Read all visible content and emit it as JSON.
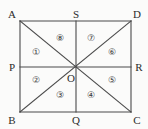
{
  "figure": {
    "type": "geometry-diagram",
    "shape": "rectangle-with-diagonals-and-midlines",
    "canvas": {
      "width": 148,
      "height": 129
    },
    "background_color": "#fbfbfa",
    "line_color": "#4a4a4a",
    "label_color": "#2b2b2b",
    "rectangle": {
      "corners": [
        {
          "name": "A",
          "x": 20,
          "y": 21
        },
        {
          "name": "D",
          "x": 131,
          "y": 21
        },
        {
          "name": "C",
          "x": 131,
          "y": 112
        },
        {
          "name": "B",
          "x": 20,
          "y": 112
        }
      ]
    },
    "points": [
      {
        "name": "A",
        "x": 20,
        "y": 21,
        "label_x": 12,
        "label_y": 14,
        "role": "corner-top-left"
      },
      {
        "name": "S",
        "x": 76,
        "y": 21,
        "label_x": 76,
        "label_y": 14,
        "role": "midpoint-top"
      },
      {
        "name": "D",
        "x": 131,
        "y": 21,
        "label_x": 137,
        "label_y": 14,
        "role": "corner-top-right"
      },
      {
        "name": "P",
        "x": 20,
        "y": 67,
        "label_x": 12,
        "label_y": 67,
        "role": "midpoint-left"
      },
      {
        "name": "O",
        "x": 76,
        "y": 67,
        "label_x": 71,
        "label_y": 78,
        "role": "center"
      },
      {
        "name": "R",
        "x": 131,
        "y": 67,
        "label_x": 139,
        "label_y": 67,
        "role": "midpoint-right"
      },
      {
        "name": "B",
        "x": 20,
        "y": 112,
        "label_x": 12,
        "label_y": 120,
        "role": "corner-bottom-left"
      },
      {
        "name": "Q",
        "x": 76,
        "y": 112,
        "label_x": 76,
        "label_y": 120,
        "role": "midpoint-bottom"
      },
      {
        "name": "C",
        "x": 131,
        "y": 112,
        "label_x": 137,
        "label_y": 120,
        "role": "corner-bottom-right"
      }
    ],
    "segments": [
      {
        "name": "side-AD",
        "from": "A",
        "to": "D",
        "x1": 20,
        "y1": 21,
        "x2": 131,
        "y2": 21
      },
      {
        "name": "side-DC",
        "from": "D",
        "to": "C",
        "x1": 131,
        "y1": 21,
        "x2": 131,
        "y2": 112
      },
      {
        "name": "side-CB",
        "from": "C",
        "to": "B",
        "x1": 131,
        "y1": 112,
        "x2": 20,
        "y2": 112
      },
      {
        "name": "side-BA",
        "from": "B",
        "to": "A",
        "x1": 20,
        "y1": 112,
        "x2": 20,
        "y2": 21
      },
      {
        "name": "midline-PR",
        "from": "P",
        "to": "R",
        "x1": 20,
        "y1": 67,
        "x2": 131,
        "y2": 67
      },
      {
        "name": "midline-SQ",
        "from": "S",
        "to": "Q",
        "x1": 76,
        "y1": 21,
        "x2": 76,
        "y2": 112
      },
      {
        "name": "diagonal-AC",
        "from": "A",
        "to": "C",
        "x1": 20,
        "y1": 21,
        "x2": 131,
        "y2": 112
      },
      {
        "name": "diagonal-BD",
        "from": "B",
        "to": "D",
        "x1": 20,
        "y1": 112,
        "x2": 131,
        "y2": 21
      }
    ],
    "regions": [
      {
        "id": 1,
        "label": "①",
        "x": 36,
        "y": 52,
        "description": "triangle A-P-O upper-left-inner"
      },
      {
        "id": 2,
        "label": "②",
        "x": 36,
        "y": 80,
        "description": "triangle P-B-O lower-left-inner"
      },
      {
        "id": 3,
        "label": "③",
        "x": 60,
        "y": 95,
        "description": "triangle B-Q-O bottom-left"
      },
      {
        "id": 4,
        "label": "④",
        "x": 91,
        "y": 95,
        "description": "triangle Q-C-O bottom-right"
      },
      {
        "id": 5,
        "label": "⑤",
        "x": 112,
        "y": 80,
        "description": "triangle O-C-R lower-right-inner"
      },
      {
        "id": 6,
        "label": "⑥",
        "x": 112,
        "y": 52,
        "description": "triangle O-R-D upper-right-inner"
      },
      {
        "id": 7,
        "label": "⑦",
        "x": 91,
        "y": 38,
        "description": "triangle S-D-O top-right"
      },
      {
        "id": 8,
        "label": "⑧",
        "x": 60,
        "y": 38,
        "description": "triangle A-S-O top-left"
      }
    ]
  }
}
